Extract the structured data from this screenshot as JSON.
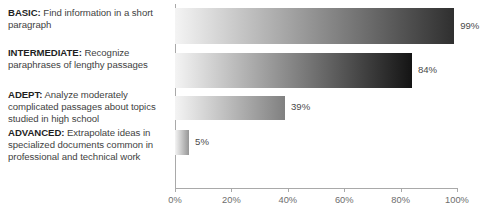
{
  "chart_data": {
    "type": "bar",
    "orientation": "horizontal",
    "title": "",
    "xlabel": "",
    "ylabel": "",
    "xlim": [
      0,
      100
    ],
    "grid": false,
    "legend": null,
    "categories": [
      "BASIC",
      "INTERMEDIATE",
      "ADEPT",
      "ADVANCED"
    ],
    "values": [
      99,
      84,
      39,
      5
    ],
    "value_labels": [
      "99%",
      "84%",
      "39%",
      "5%"
    ],
    "tick_labels": [
      "0%",
      "20%",
      "40%",
      "60%",
      "80%",
      "100%"
    ],
    "tick_values": [
      0,
      20,
      40,
      60,
      80,
      100
    ],
    "bar_style": "horizontal-gradient-light-to-dark",
    "bar_gradient_start": "#f4f4f4",
    "bar_gradient_end": "#1a1a1a",
    "axis_color": "#a9a9a9",
    "text_color": "#3f3f3f"
  },
  "categories": [
    {
      "tier": "BASIC:",
      "desc": " Find information in a short paragraph",
      "value_label": "99%"
    },
    {
      "tier": "INTERMEDIATE:",
      "desc": " Recognize paraphrases of lengthy passages",
      "value_label": "84%"
    },
    {
      "tier": "ADEPT:",
      "desc": " Analyze moderately complicated passages about topics studied in high school",
      "value_label": "39%"
    },
    {
      "tier": "ADVANCED:",
      "desc": " Extrapolate ideas in specialized documents common in professional and technical work",
      "value_label": "5%"
    }
  ],
  "axis": {
    "ticks": [
      {
        "label": "0%"
      },
      {
        "label": "20%"
      },
      {
        "label": "40%"
      },
      {
        "label": "60%"
      },
      {
        "label": "80%"
      },
      {
        "label": "100%"
      }
    ]
  }
}
